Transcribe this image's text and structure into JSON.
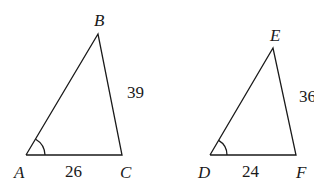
{
  "diagram": {
    "type": "similar-triangles",
    "triangles": [
      {
        "name": "ABC",
        "vertices": {
          "A": "A",
          "B": "B",
          "C": "C"
        },
        "sides": {
          "BC": "39",
          "AC": "26"
        },
        "marked_angle": "A"
      },
      {
        "name": "DEF",
        "vertices": {
          "D": "D",
          "E": "E",
          "F": "F"
        },
        "sides": {
          "EF": "36",
          "DF": "24"
        },
        "marked_angle": "D"
      }
    ]
  }
}
